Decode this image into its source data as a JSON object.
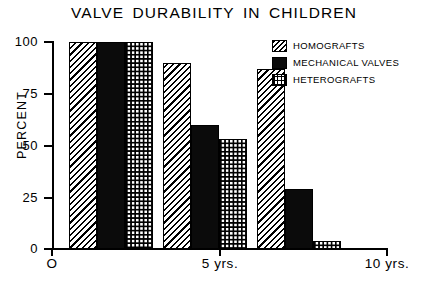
{
  "chart_data": {
    "type": "bar",
    "title": "VALVE DURABILITY IN CHILDREN",
    "xlabel": "",
    "ylabel": "PERCENT",
    "categories": [
      "O",
      "5 yrs.",
      "10 yrs."
    ],
    "series": [
      {
        "name": "HOMOGRAFTS",
        "values": [
          100,
          90,
          87
        ],
        "pattern": "diagonal-hatch"
      },
      {
        "name": "MECHANICAL VALVES",
        "values": [
          100,
          60,
          29
        ],
        "pattern": "solid-black"
      },
      {
        "name": "HETEROGRAFTS",
        "values": [
          100,
          53,
          4
        ],
        "pattern": "dotted-grid"
      }
    ],
    "ylim": [
      0,
      100
    ],
    "yticks": [
      0,
      25,
      50,
      75,
      100
    ],
    "ytick_labels": [
      "0",
      "25",
      "50",
      "75",
      "100"
    ],
    "grid": false,
    "legend_position": "top-right"
  },
  "axes": {
    "y_title": "PERCENT",
    "y_ticks": [
      {
        "label": "100",
        "value": 100
      },
      {
        "label": "75",
        "value": 75
      },
      {
        "label": "50",
        "value": 50
      },
      {
        "label": "25",
        "value": 25
      },
      {
        "label": "0",
        "value": 0
      }
    ],
    "x_ticks": [
      {
        "label": "O",
        "value": 0
      },
      {
        "label": "5 yrs.",
        "value": 5
      },
      {
        "label": "10 yrs.",
        "value": 10
      }
    ]
  },
  "legend": {
    "items": [
      {
        "label": "HOMOGRAFTS",
        "swatch": "diagonal-hatch-swatch"
      },
      {
        "label": "MECHANICAL VALVES",
        "swatch": "solid-black-swatch"
      },
      {
        "label": "HETEROGRAFTS",
        "swatch": "dotted-grid-swatch"
      }
    ]
  },
  "groups": [
    {
      "name": "O",
      "bars": [
        {
          "series": "HOMOGRAFTS",
          "value": 100
        },
        {
          "series": "MECHANICAL VALVES",
          "value": 100
        },
        {
          "series": "HETEROGRAFTS",
          "value": 100
        }
      ]
    },
    {
      "name": "5 yrs.",
      "bars": [
        {
          "series": "HOMOGRAFTS",
          "value": 90
        },
        {
          "series": "MECHANICAL VALVES",
          "value": 60
        },
        {
          "series": "HETEROGRAFTS",
          "value": 53
        }
      ]
    },
    {
      "name": "10 yrs.",
      "bars": [
        {
          "series": "HOMOGRAFTS",
          "value": 87
        },
        {
          "series": "MECHANICAL VALVES",
          "value": 29
        },
        {
          "series": "HETEROGRAFTS",
          "value": 4
        }
      ]
    }
  ],
  "colors": {
    "ink": "#000000",
    "background": "#ffffff"
  }
}
